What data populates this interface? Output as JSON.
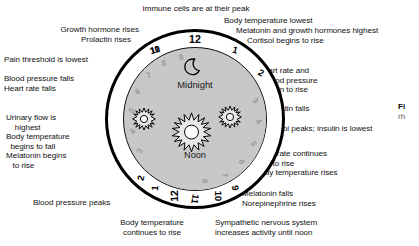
{
  "figure": {
    "type": "circadian-rhythm-clock-diagram",
    "clock": {
      "top_label": "Midnight",
      "bottom_label": "Noon",
      "moon_icon": "moon-icon",
      "sun_icons": [
        "sun-icon-small-left",
        "sun-icon-large-center",
        "sun-icon-small-right"
      ],
      "outer_ring_numbers": [
        "12",
        "1",
        "2",
        "10",
        "11",
        "9",
        "10",
        "11",
        "12",
        "1",
        "2"
      ],
      "inner_ring_numbers": [
        "3",
        "4",
        "5",
        "6",
        "7",
        "8",
        "9",
        "3",
        "4",
        "5",
        "6",
        "7",
        "8",
        "9"
      ],
      "hours": [
        {
          "n": "11",
          "ring": "outer",
          "ang": -30,
          "big": false
        },
        {
          "n": "12",
          "ring": "outer",
          "ang": 0,
          "big": true
        },
        {
          "n": "1",
          "ring": "outer",
          "ang": 30,
          "big": false
        },
        {
          "n": "2",
          "ring": "outer",
          "ang": 55,
          "big": false
        },
        {
          "n": "3",
          "ring": "inner",
          "ang": 73,
          "big": false
        },
        {
          "n": "4",
          "ring": "inner",
          "ang": 93,
          "big": false
        },
        {
          "n": "5",
          "ring": "inner",
          "ang": 113,
          "big": false
        },
        {
          "n": "6",
          "ring": "inner",
          "ang": 133,
          "big": false
        },
        {
          "n": "7",
          "ring": "inner",
          "ang": 153,
          "big": false
        },
        {
          "n": "8",
          "ring": "inner",
          "ang": 172,
          "big": false
        },
        {
          "n": "9",
          "ring": "outer",
          "ang": 150,
          "big": false
        },
        {
          "n": "10",
          "ring": "outer",
          "ang": 163,
          "big": false
        },
        {
          "n": "11",
          "ring": "outer",
          "ang": 180,
          "big": false
        },
        {
          "n": "12",
          "ring": "outer",
          "ang": 195,
          "big": true
        },
        {
          "n": "1",
          "ring": "outer",
          "ang": 210,
          "big": false
        },
        {
          "n": "2",
          "ring": "outer",
          "ang": 222,
          "big": false
        },
        {
          "n": "3",
          "ring": "inner",
          "ang": 240,
          "big": false
        },
        {
          "n": "4",
          "ring": "inner",
          "ang": 258,
          "big": false
        },
        {
          "n": "5",
          "ring": "inner",
          "ang": 277,
          "big": false
        },
        {
          "n": "6",
          "ring": "inner",
          "ang": 295,
          "big": false
        },
        {
          "n": "7",
          "ring": "inner",
          "ang": 313,
          "big": false
        },
        {
          "n": "8",
          "ring": "inner",
          "ang": 330,
          "big": false
        },
        {
          "n": "9",
          "ring": "inner",
          "ang": 347,
          "big": false
        },
        {
          "n": "10",
          "ring": "outer",
          "ang": 330,
          "big": false
        }
      ]
    },
    "annotations": {
      "top_center": "Immune cells are at their peak",
      "top_left_1": "Growth hormone rises",
      "top_left_2": "Prolactin rises",
      "left_1": "Pain threshold is lowest",
      "left_2": "Blood pressure falls\nHeart rate falls",
      "left_3": "Urinary flow is\n    highest\nBody temperature\n  begins to fall\nMelatonin begins\n   to rise",
      "bottom_left": "Blood pressure peaks",
      "bottom_center": "Body temperature\ncontinues to rise",
      "bottom_right": "Sympathetic nervous system\nincreases activity until noon",
      "right_1": "Body temperature lowest",
      "right_2": "Melatonin and growth hormones highest",
      "right_3": "Cortisol begins to rise",
      "right_4": "Heart rate and\n   blood pressure\n   begin to rise",
      "right_5": "Prolactin falls",
      "right_6": "Cortisol peaks; insulin is lowest",
      "right_7": "Heart rate continues\n        to rise\nBody temperature rises",
      "right_8": "Melatonin falls\nNorepinephrine rises"
    },
    "caption": {
      "bold_fragment": "Fi",
      "body_fragment": "rh"
    },
    "colors": {
      "dial_fill": "#c8c8c8",
      "ring_stroke": "#000000",
      "outer_number": "#000000",
      "inner_number": "#9a9a9a",
      "text": "#111111",
      "background": "#ffffff"
    }
  }
}
